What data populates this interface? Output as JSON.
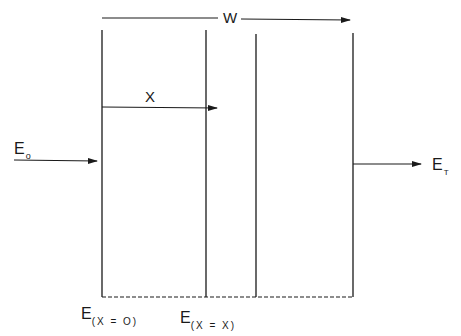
{
  "diagram": {
    "type": "layered-medium-transmission",
    "labels": {
      "width": "W",
      "depth": "X",
      "incident_main": "E",
      "incident_sub": "o",
      "transmitted_main": "E",
      "transmitted_sub": "T",
      "surface_main": "E",
      "surface_sub": "(X = O)",
      "depth_field_main": "E",
      "depth_field_sub": "(X = X)"
    },
    "colors": {
      "line": "#1a1a1a",
      "background": "#ffffff"
    }
  }
}
